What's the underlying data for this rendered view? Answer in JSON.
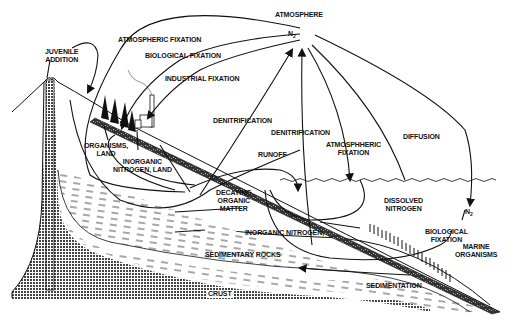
{
  "diagram": {
    "type": "nitrogen-cycle",
    "colors": {
      "ink": "#111111",
      "background": "#ffffff",
      "stipple": "#555555"
    },
    "labels": {
      "atmosphere": "ATMOSPHERE",
      "n2_atmosphere": "N",
      "n2_atmosphere_sub": "2",
      "juvenile_addition_1": "JUVENILE",
      "juvenile_addition_2": "ADDITION",
      "atmospheric_fixation_land": "ATMOSPHERIC FIXATION",
      "biological_fixation_land": "BIOLOGICAL FIXATION",
      "industrial_fixation": "INDUSTRIAL FIXATION",
      "denitrification_land": "DENITRIFICATION",
      "denitrification_sea": "DENITRIFICATION",
      "atmospheric_fixation_sea_1": "ATMOSPHHERIC",
      "atmospheric_fixation_sea_2": "FIXATION",
      "diffusion": "DIFFUSION",
      "runoff": "RUNOFF",
      "organisms_land_1": "ORGANISMS,",
      "organisms_land_2": "LAND",
      "inorganic_nitrogen_land_1": "INORGANIC",
      "inorganic_nitrogen_land_2": "NITROGEN, LAND",
      "decaying_organic_matter_1": "DECAYING",
      "decaying_organic_matter_2": "ORGANIC",
      "decaying_organic_matter_3": "MATTER",
      "dissolved_nitrogen_1": "DISSOLVED",
      "dissolved_nitrogen_2": "NITROGEN",
      "n2_sea": "N",
      "n2_sea_sub": "2",
      "biological_fixation_sea_1": "BIOLOGICAL",
      "biological_fixation_sea_2": "FIXATION",
      "marine_organisms_1": "MARINE",
      "marine_organisms_2": "ORGANISMS",
      "inorganic_nitrogen_sea": "INORGANIC NITROGEN,",
      "sedimentary_rocks": "SEDIMENTARY ROCKS",
      "sedimentation": "SEDIMENTATION",
      "crust": "CRUST"
    }
  }
}
